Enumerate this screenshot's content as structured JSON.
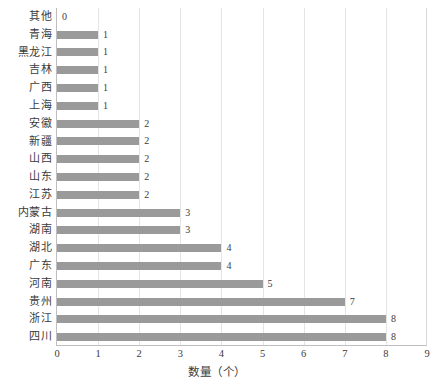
{
  "chart_data": {
    "type": "bar",
    "orientation": "horizontal",
    "title": "",
    "xlabel": "数量（个）",
    "ylabel": "",
    "xlim": [
      0,
      9
    ],
    "xticks": [
      0,
      1,
      2,
      3,
      4,
      5,
      6,
      7,
      8,
      9
    ],
    "grid": true,
    "legend": false,
    "bar_color": "#9a9a9a",
    "grid_color": "#e4e4e4",
    "axis_color": "#bfbfbf",
    "categories": [
      "其他",
      "青海",
      "黑龙江",
      "吉林",
      "广西",
      "上海",
      "安徽",
      "新疆",
      "山西",
      "山东",
      "江苏",
      "内蒙古",
      "湖南",
      "湖北",
      "广东",
      "河南",
      "贵州",
      "浙江",
      "四川"
    ],
    "values": [
      0,
      1,
      1,
      1,
      1,
      1,
      2,
      2,
      2,
      2,
      2,
      3,
      3,
      4,
      4,
      5,
      7,
      8,
      8
    ],
    "data_labels": [
      "0",
      "1",
      "1",
      "1",
      "1",
      "1",
      "2",
      "2",
      "2",
      "2",
      "2",
      "3",
      "3",
      "4",
      "4",
      "5",
      "7",
      "8",
      "8"
    ]
  }
}
